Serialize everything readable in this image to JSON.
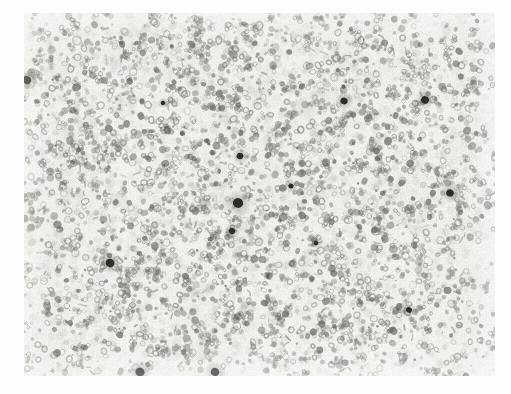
{
  "page": {
    "background_color": "#fdfdfd",
    "width": 511,
    "height": 394
  },
  "micrograph": {
    "name": "histology-photomicrograph",
    "caption": "",
    "panel": {
      "x": 24,
      "y": 13,
      "width": 471,
      "height": 363
    },
    "field_background_color": "#f2f1ee",
    "stain_tone_color": "#8e8b86",
    "dark_object_color": "#2e2c2b",
    "edge_vignette_color": "#f7f6f4",
    "description": "Dense field of small rounded cell nuclei on pale background with scattered dark punctate bodies",
    "cell_count_estimate": 2600,
    "dark_bodies": [
      {
        "x": 27,
        "y": 80,
        "r": 4.2
      },
      {
        "x": 344,
        "y": 101,
        "r": 3.6
      },
      {
        "x": 425,
        "y": 100,
        "r": 4.0
      },
      {
        "x": 240,
        "y": 156,
        "r": 3.4
      },
      {
        "x": 238,
        "y": 203,
        "r": 5.2
      },
      {
        "x": 450,
        "y": 193,
        "r": 3.8
      },
      {
        "x": 232,
        "y": 231,
        "r": 3.2
      },
      {
        "x": 110,
        "y": 263,
        "r": 4.4
      },
      {
        "x": 409,
        "y": 310,
        "r": 3.0
      },
      {
        "x": 140,
        "y": 372,
        "r": 4.6
      },
      {
        "x": 215,
        "y": 372,
        "r": 4.2
      },
      {
        "x": 291,
        "y": 186,
        "r": 2.6
      },
      {
        "x": 316,
        "y": 243,
        "r": 2.4
      },
      {
        "x": 163,
        "y": 103,
        "r": 2.2
      }
    ],
    "density_hotspots": [
      {
        "x": 0.22,
        "y": 0.22,
        "weight": 1.25
      },
      {
        "x": 0.55,
        "y": 0.18,
        "weight": 1.15
      },
      {
        "x": 0.4,
        "y": 0.5,
        "weight": 1.1
      },
      {
        "x": 0.78,
        "y": 0.42,
        "weight": 1.05
      },
      {
        "x": 0.62,
        "y": 0.78,
        "weight": 1.0
      },
      {
        "x": 0.15,
        "y": 0.7,
        "weight": 0.95
      }
    ]
  }
}
